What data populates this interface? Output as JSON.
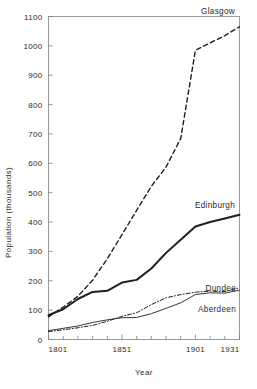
{
  "chart_data": {
    "type": "line",
    "title": "",
    "xlabel": "Year",
    "ylabel": "Population (thousands)",
    "xlim": [
      1801,
      1931
    ],
    "ylim": [
      0,
      1100
    ],
    "grid": false,
    "legend_position": "inline-end-of-line",
    "x_ticks_major": [
      1801,
      1851,
      1901,
      1931
    ],
    "x_tick_labels": [
      "1801",
      "1851",
      "1901",
      "1931"
    ],
    "x_ticks_minor": [
      1811,
      1821,
      1831,
      1841,
      1861,
      1871,
      1881,
      1891,
      1911,
      1921
    ],
    "y_ticks": [
      0,
      100,
      200,
      300,
      400,
      500,
      600,
      700,
      800,
      900,
      1000,
      1100
    ],
    "y_tick_labels": [
      "0",
      "100",
      "200",
      "300",
      "400",
      "500",
      "600",
      "700",
      "800",
      "900",
      "1000",
      "1100"
    ],
    "x": [
      1801,
      1811,
      1821,
      1831,
      1841,
      1851,
      1861,
      1871,
      1881,
      1891,
      1901,
      1911,
      1921,
      1931
    ],
    "series": [
      {
        "name": "Glasgow",
        "label": "Glasgow",
        "style": "dashed",
        "values": [
          77,
          110,
          147,
          202,
          275,
          357,
          440,
          522,
          587,
          685,
          985,
          1010,
          1035,
          1065
        ]
      },
      {
        "name": "Edinburgh",
        "label": "Edinburgh",
        "style": "solid-thick",
        "values": [
          83,
          103,
          138,
          162,
          166,
          194,
          203,
          242,
          295,
          340,
          385,
          400,
          412,
          425
        ]
      },
      {
        "name": "Dundee",
        "label": "Dundee",
        "style": "dash-dot",
        "values": [
          27,
          33,
          40,
          48,
          62,
          79,
          91,
          119,
          142,
          153,
          161,
          165,
          163,
          176
        ]
      },
      {
        "name": "Aberdeen",
        "label": "Aberdeen",
        "style": "solid-thin",
        "values": [
          30,
          38,
          46,
          58,
          67,
          74,
          75,
          88,
          106,
          125,
          153,
          159,
          158,
          168
        ]
      }
    ]
  },
  "axis": {
    "y_title": "Population (thousands)",
    "x_title": "Year"
  },
  "colors": {
    "line": "#1f1f1f",
    "frame": "#9a9a9a",
    "text": "#2b2b2b",
    "background": "#ffffff"
  }
}
